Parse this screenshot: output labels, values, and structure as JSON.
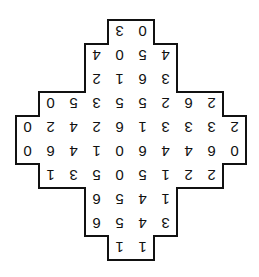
{
  "puzzle": {
    "orientation": "rotated-180",
    "grid": {
      "origin_x": 16,
      "origin_y": 20,
      "cell_w": 23,
      "cell_h": 24,
      "cols": 10,
      "rows": 10
    },
    "rows": [
      {
        "start_col": 4,
        "values": [
          "3",
          "0"
        ]
      },
      {
        "start_col": 3,
        "values": [
          "4",
          "0",
          "5",
          "4"
        ]
      },
      {
        "start_col": 3,
        "values": [
          "2",
          "1",
          "6",
          "3"
        ]
      },
      {
        "start_col": 1,
        "values": [
          "0",
          "5",
          "3",
          "5",
          "5",
          "2",
          "6",
          "2"
        ]
      },
      {
        "start_col": 0,
        "values": [
          "0",
          "2",
          "4",
          "2",
          "6",
          "1",
          "3",
          "3",
          "3",
          "2"
        ]
      },
      {
        "start_col": 0,
        "values": [
          "0",
          "6",
          "4",
          "1",
          "0",
          "6",
          "4",
          "4",
          "6",
          "0"
        ]
      },
      {
        "start_col": 1,
        "values": [
          "1",
          "3",
          "5",
          "0",
          "5",
          "1",
          "2",
          "2"
        ]
      },
      {
        "start_col": 3,
        "values": [
          "6",
          "5",
          "4",
          "1"
        ]
      },
      {
        "start_col": 3,
        "values": [
          "6",
          "5",
          "4",
          "3"
        ]
      },
      {
        "start_col": 4,
        "values": [
          "1",
          "1"
        ]
      }
    ],
    "colors": {
      "border": "#111111",
      "text": "#111111",
      "background": "#ffffff"
    }
  }
}
